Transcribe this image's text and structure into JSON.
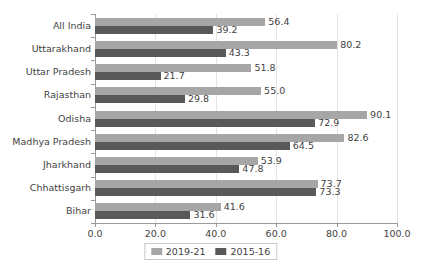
{
  "chart_data": {
    "type": "bar",
    "orientation": "horizontal",
    "title": "",
    "subtitle": "",
    "xlabel": "",
    "ylabel": "",
    "xlim": [
      0.0,
      100.0
    ],
    "xticks": [
      "0.0",
      "20.0",
      "40.0",
      "60.0",
      "80.0",
      "100.0"
    ],
    "xtick_values": [
      0.0,
      20.0,
      40.0,
      60.0,
      80.0,
      100.0
    ],
    "grid": "vertical",
    "legend_position": "bottom-center",
    "categories": [
      "All India",
      "Uttarakhand",
      "Uttar Pradesh",
      "Rajasthan",
      "Odisha",
      "Madhya Pradesh",
      "Jharkhand",
      "Chhattisgarh",
      "Bihar"
    ],
    "series": [
      {
        "name": "2019-21",
        "color": "#a6a6a6",
        "values": [
          56.4,
          80.2,
          51.8,
          55.0,
          90.1,
          82.6,
          53.9,
          73.7,
          41.6
        ],
        "labels": [
          "56.4",
          "80.2",
          "51.8",
          "55.0",
          "90.1",
          "82.6",
          "53.9",
          "73.7",
          "41.6"
        ]
      },
      {
        "name": "2015-16",
        "color": "#595959",
        "values": [
          39.2,
          43.3,
          21.7,
          29.8,
          72.9,
          64.5,
          47.8,
          73.3,
          31.6
        ],
        "labels": [
          "39.2",
          "43.3",
          "21.7",
          "29.8",
          "72.9",
          "64.5",
          "47.8",
          "73.3",
          "31.6"
        ]
      }
    ]
  },
  "legend": {
    "items": [
      {
        "label": "2019-21"
      },
      {
        "label": "2015-16"
      }
    ]
  },
  "colors": {
    "series_2019_21": "#a6a6a6",
    "series_2015_16": "#595959",
    "axis": "#9a9a9a",
    "gridline": "#e4e4e4",
    "text": "#3f3f3f",
    "background": "#ffffff"
  }
}
